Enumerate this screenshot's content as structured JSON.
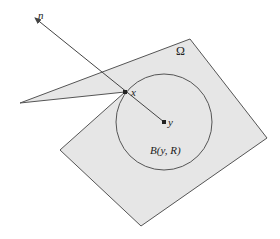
{
  "diagram": {
    "labels": {
      "normal": "n",
      "boundary_point": "x",
      "center": "y",
      "domain": "Ω",
      "ball": "B(y, R)"
    },
    "colors": {
      "domain_fill": "#e6e6e6",
      "stroke": "#555555",
      "point": "#222222"
    },
    "geometry": {
      "domain_polygon": [
        [
          20,
          103
        ],
        [
          190,
          39
        ],
        [
          267,
          138
        ],
        [
          141,
          226
        ],
        [
          60,
          150
        ],
        [
          125,
          92
        ]
      ],
      "ball_center": [
        164,
        122
      ],
      "ball_radius": 48,
      "point_x": [
        125,
        92
      ],
      "normal_tip": [
        35,
        18
      ]
    }
  }
}
